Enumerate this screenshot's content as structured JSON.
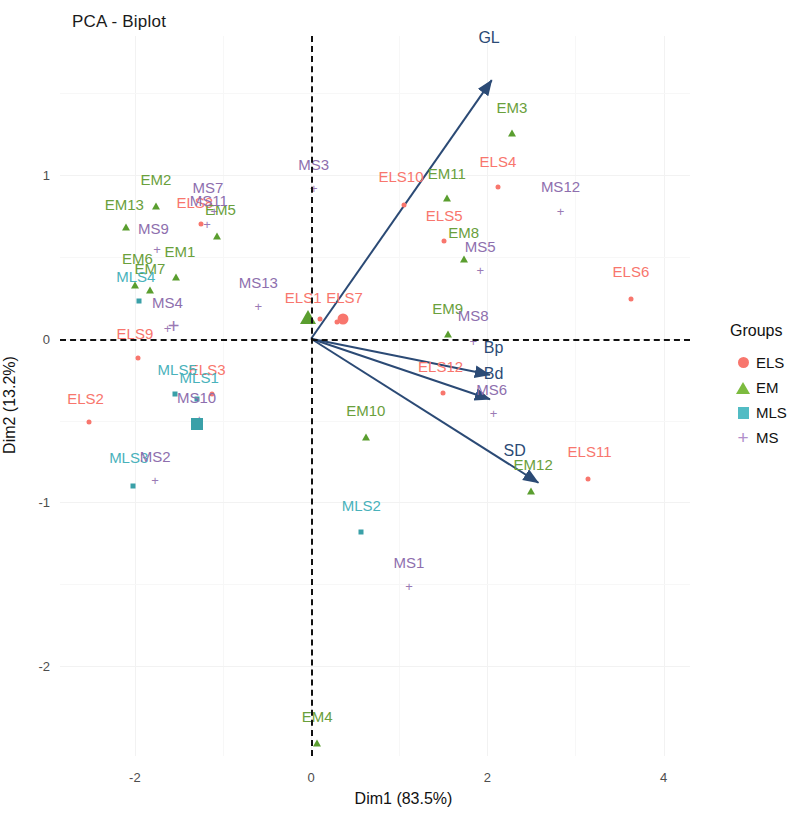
{
  "title": "PCA - Biplot",
  "axes": {
    "xlabel": "Dim1 (83.5%)",
    "ylabel": "Dim2 (13.2%)",
    "xticks": [
      "-2",
      "0",
      "2",
      "4"
    ],
    "xtickvals": [
      -2,
      0,
      2,
      4
    ],
    "yticks": [
      "1",
      "0",
      "-1",
      "-2"
    ],
    "ytickvals": [
      1,
      0,
      -1,
      -2
    ],
    "xlim": [
      -2.85,
      4.3
    ],
    "ylim": [
      -2.55,
      1.85
    ]
  },
  "legend": {
    "title": "Groups",
    "items": [
      {
        "label": "ELS",
        "shape": "circle",
        "color": "#f8766d"
      },
      {
        "label": "EM",
        "shape": "triangle",
        "color": "#7cbb3f"
      },
      {
        "label": "MLS",
        "shape": "square",
        "color": "#52bcc4"
      },
      {
        "label": "MS",
        "shape": "plus",
        "color": "#b18fcb"
      }
    ]
  },
  "chart_data": {
    "type": "scatter",
    "title": "PCA - Biplot",
    "xlabel": "Dim1 (83.5%)",
    "ylabel": "Dim2 (13.2%)",
    "xlim": [
      -2.85,
      4.3
    ],
    "ylim": [
      -2.55,
      1.85
    ],
    "grid": true,
    "legend_position": "right",
    "groups": [
      "ELS",
      "EM",
      "MLS",
      "MS"
    ],
    "group_colors": {
      "ELS": "#f8766d",
      "EM": "#6aa03c",
      "MLS": "#49b2bb",
      "MS": "#8e6fae"
    },
    "variable_vectors": [
      {
        "name": "GL",
        "x": 2.05,
        "y": 1.58,
        "label_x": 2.02,
        "label_y": 1.78
      },
      {
        "name": "Bp",
        "x": 2.03,
        "y": -0.22,
        "label_x": 2.07,
        "label_y": -0.11
      },
      {
        "name": "Bd",
        "x": 2.03,
        "y": -0.37,
        "label_x": 2.07,
        "label_y": -0.27
      },
      {
        "name": "SD",
        "x": 2.58,
        "y": -0.88,
        "label_x": 2.31,
        "label_y": -0.74
      }
    ],
    "points": [
      {
        "label": "ELS1",
        "group": "ELS",
        "x": 0.1,
        "y": 0.12,
        "label_x": -0.09,
        "label_y": 0.2
      },
      {
        "label": "ELS2",
        "group": "ELS",
        "x": -2.52,
        "y": -0.51,
        "label_x": -2.56,
        "label_y": -0.42
      },
      {
        "label": "ELS3",
        "group": "ELS",
        "x": -1.13,
        "y": -0.34,
        "label_x": -1.18,
        "label_y": -0.24
      },
      {
        "label": "ELS4",
        "group": "ELS",
        "x": 2.12,
        "y": 0.93,
        "label_x": 2.12,
        "label_y": 1.03
      },
      {
        "label": "ELS5",
        "group": "ELS",
        "x": 1.51,
        "y": 0.6,
        "label_x": 1.51,
        "label_y": 0.7
      },
      {
        "label": "ELS6",
        "group": "ELS",
        "x": 3.63,
        "y": 0.24,
        "label_x": 3.63,
        "label_y": 0.36
      },
      {
        "label": "ELS7",
        "group": "ELS",
        "x": 0.29,
        "y": 0.1,
        "label_x": 0.38,
        "label_y": 0.2
      },
      {
        "label": "ELS8",
        "group": "ELS",
        "x": -1.25,
        "y": 0.7,
        "label_x": -1.32,
        "label_y": 0.78
      },
      {
        "label": "ELS9",
        "group": "ELS",
        "x": -1.96,
        "y": -0.12,
        "label_x": -2.0,
        "label_y": -0.02
      },
      {
        "label": "ELS10",
        "group": "ELS",
        "x": 1.05,
        "y": 0.82,
        "label_x": 1.02,
        "label_y": 0.94
      },
      {
        "label": "ELS11",
        "group": "ELS",
        "x": 3.14,
        "y": -0.86,
        "label_x": 3.16,
        "label_y": -0.74
      },
      {
        "label": "ELS12",
        "group": "ELS",
        "x": 1.5,
        "y": -0.33,
        "label_x": 1.47,
        "label_y": -0.22
      },
      {
        "label": "EM1",
        "group": "EM",
        "x": -1.53,
        "y": 0.38,
        "label_x": -1.49,
        "label_y": 0.48
      },
      {
        "label": "EM2",
        "group": "EM",
        "x": -1.76,
        "y": 0.81,
        "label_x": -1.76,
        "label_y": 0.92
      },
      {
        "label": "EM3",
        "group": "EM",
        "x": 2.28,
        "y": 1.26,
        "label_x": 2.28,
        "label_y": 1.36
      },
      {
        "label": "EM4",
        "group": "EM",
        "x": 0.07,
        "y": -2.47,
        "label_x": 0.07,
        "label_y": -2.36
      },
      {
        "label": "EM5",
        "group": "EM",
        "x": -1.07,
        "y": 0.63,
        "label_x": -1.03,
        "label_y": 0.74
      },
      {
        "label": "EM6",
        "group": "EM",
        "x": -2.0,
        "y": 0.33,
        "label_x": -1.97,
        "label_y": 0.44
      },
      {
        "label": "EM7",
        "group": "EM",
        "x": -1.83,
        "y": 0.3,
        "label_x": -1.83,
        "label_y": 0.38
      },
      {
        "label": "EM8",
        "group": "EM",
        "x": 1.73,
        "y": 0.49,
        "label_x": 1.73,
        "label_y": 0.6
      },
      {
        "label": "EM9",
        "group": "EM",
        "x": 1.55,
        "y": 0.03,
        "label_x": 1.55,
        "label_y": 0.13
      },
      {
        "label": "EM10",
        "group": "EM",
        "x": 0.62,
        "y": -0.6,
        "label_x": 0.62,
        "label_y": -0.49
      },
      {
        "label": "EM11",
        "group": "EM",
        "x": 1.54,
        "y": 0.86,
        "label_x": 1.54,
        "label_y": 0.96
      },
      {
        "label": "EM12",
        "group": "EM",
        "x": 2.5,
        "y": -0.93,
        "label_x": 2.52,
        "label_y": -0.82
      },
      {
        "label": "EM13",
        "group": "EM",
        "x": -2.1,
        "y": 0.68,
        "label_x": -2.12,
        "label_y": 0.77
      },
      {
        "label": "MLS1",
        "group": "MLS",
        "x": -1.3,
        "y": -0.37,
        "label_x": -1.27,
        "label_y": -0.29
      },
      {
        "label": "MLS2",
        "group": "MLS",
        "x": 0.57,
        "y": -1.18,
        "label_x": 0.57,
        "label_y": -1.07
      },
      {
        "label": "MLS3",
        "group": "MLS",
        "x": -2.02,
        "y": -0.9,
        "label_x": -2.07,
        "label_y": -0.78
      },
      {
        "label": "MLS4",
        "group": "MLS",
        "x": -1.95,
        "y": 0.23,
        "label_x": -1.99,
        "label_y": 0.33
      },
      {
        "label": "MLS5",
        "group": "MLS",
        "x": -1.55,
        "y": -0.34,
        "label_x": -1.52,
        "label_y": -0.24
      },
      {
        "label": "MS1",
        "group": "MS",
        "x": 1.11,
        "y": -1.53,
        "label_x": 1.11,
        "label_y": -1.42
      },
      {
        "label": "MS2",
        "group": "MS",
        "x": -1.77,
        "y": -0.88,
        "label_x": -1.77,
        "label_y": -0.77
      },
      {
        "label": "MS3",
        "group": "MS",
        "x": 0.03,
        "y": 0.9,
        "label_x": 0.03,
        "label_y": 1.01
      },
      {
        "label": "MS4",
        "group": "MS",
        "x": -1.63,
        "y": 0.05,
        "label_x": -1.63,
        "label_y": 0.17
      },
      {
        "label": "MS5",
        "group": "MS",
        "x": 1.92,
        "y": 0.4,
        "label_x": 1.92,
        "label_y": 0.51
      },
      {
        "label": "MS6",
        "group": "MS",
        "x": 2.07,
        "y": -0.47,
        "label_x": 2.05,
        "label_y": -0.36
      },
      {
        "label": "MS7",
        "group": "MS",
        "x": -1.1,
        "y": 0.76,
        "label_x": -1.17,
        "label_y": 0.87
      },
      {
        "label": "MS8",
        "group": "MS",
        "x": 1.84,
        "y": -0.03,
        "label_x": 1.84,
        "label_y": 0.09
      },
      {
        "label": "MS9",
        "group": "MS",
        "x": -1.75,
        "y": 0.53,
        "label_x": -1.79,
        "label_y": 0.62
      },
      {
        "label": "MS10",
        "group": "MS",
        "x": -1.27,
        "y": -0.51,
        "label_x": -1.3,
        "label_y": -0.41
      },
      {
        "label": "MS11",
        "group": "MS",
        "x": -1.18,
        "y": 0.68,
        "label_x": -1.16,
        "label_y": 0.79
      },
      {
        "label": "MS12",
        "group": "MS",
        "x": 2.83,
        "y": 0.76,
        "label_x": 2.83,
        "label_y": 0.88
      },
      {
        "label": "MS13",
        "group": "MS",
        "x": -0.6,
        "y": 0.18,
        "label_x": -0.6,
        "label_y": 0.29
      }
    ],
    "group_centroids": [
      {
        "label": "ELS",
        "group": "ELS",
        "x": 0.36,
        "y": 0.12
      },
      {
        "label": "EM",
        "group": "EM",
        "x": -0.04,
        "y": 0.13
      },
      {
        "label": "MLS",
        "group": "MLS",
        "x": -1.29,
        "y": -0.52
      },
      {
        "label": "MS",
        "group": "MS",
        "x": -1.56,
        "y": 0.04
      }
    ]
  }
}
